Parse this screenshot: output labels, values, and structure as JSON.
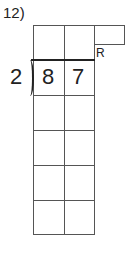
{
  "problem": {
    "number_label": "12)",
    "divisor": "2",
    "dividend_digits": [
      "8",
      "7"
    ],
    "remainder_label": "R"
  }
}
